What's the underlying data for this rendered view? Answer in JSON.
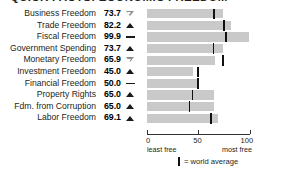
{
  "title": "QUICK FACTS: ECONOMIC FREEDOM",
  "legend": {
    "mark": "|",
    "text": "= world average"
  },
  "axis": {
    "ticks": [
      "0",
      "50",
      "100"
    ],
    "tick_values": [
      0,
      50,
      100
    ],
    "left_label": "least free",
    "right_label": "most free"
  },
  "colors": {
    "bar": "#c9c9c9",
    "average_mark": "#111111",
    "text": "#231f20",
    "trend_up": "#1a1a1a",
    "trend_down": "#8d8d8d"
  },
  "rows": [
    {
      "label": "Business Freedom",
      "value": "73.7",
      "trend": "down"
    },
    {
      "label": "Trade Freedom",
      "value": "82.2",
      "trend": "up"
    },
    {
      "label": "Fiscal Freedom",
      "value": "99.9",
      "trend": "flat"
    },
    {
      "label": "Government Spending",
      "value": "73.7",
      "trend": "up"
    },
    {
      "label": "Monetary Freedom",
      "value": "65.9",
      "trend": "down"
    },
    {
      "label": "Investment Freedom",
      "value": "45.0",
      "trend": "up"
    },
    {
      "label": "Financial Freedom",
      "value": "50.0",
      "trend": "flat"
    },
    {
      "label": "Property Rights",
      "value": "65.0",
      "trend": "up"
    },
    {
      "label": "Fdm. from Corruption",
      "value": "65.0",
      "trend": "up"
    },
    {
      "label": "Labor Freedom",
      "value": "69.1",
      "trend": "up"
    }
  ],
  "chart_data": {
    "type": "bar",
    "orientation": "horizontal",
    "title": "QUICK FACTS: ECONOMIC FREEDOM",
    "xlabel": "",
    "ylabel": "",
    "xlim": [
      0,
      100
    ],
    "grid": false,
    "legend": "| = world average",
    "categories": [
      "Business Freedom",
      "Trade Freedom",
      "Fiscal Freedom",
      "Government Spending",
      "Monetary Freedom",
      "Investment Freedom",
      "Financial Freedom",
      "Property Rights",
      "Fdm. from Corruption",
      "Labor Freedom"
    ],
    "values": [
      73.7,
      82.2,
      99.9,
      73.7,
      65.9,
      45.0,
      50.0,
      65.0,
      65.0,
      69.1
    ],
    "world_average": [
      64.5,
      74.5,
      76.0,
      64.0,
      73.5,
      49.0,
      48.5,
      43.5,
      40.5,
      61.5
    ],
    "trends": [
      "down",
      "up",
      "flat",
      "up",
      "down",
      "up",
      "flat",
      "up",
      "up",
      "up"
    ],
    "axis_ticks": [
      0,
      50,
      100
    ],
    "axis_tick_labels": [
      "0",
      "50",
      "100"
    ],
    "axis_left_annotation": "least free",
    "axis_right_annotation": "most free"
  }
}
